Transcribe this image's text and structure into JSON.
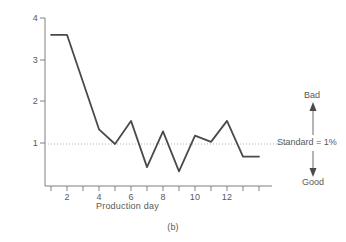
{
  "caption": "(b)",
  "axes": {
    "ylabel": "Defective parts (%)",
    "xlabel": "Production day",
    "yticks": [
      "1",
      "2",
      "3",
      "4"
    ],
    "xticks": [
      "2",
      "4",
      "6",
      "8",
      "10",
      "12"
    ]
  },
  "annotations": {
    "bad": "Bad",
    "good": "Good",
    "standard": "Standard = 1%"
  },
  "colors": {
    "line": "#4a4a4a",
    "axis": "#808080",
    "text": "#595959",
    "reference": "#b0b0b0"
  },
  "chart_data": {
    "type": "line",
    "title": "",
    "xlabel": "Production day",
    "ylabel": "Defective parts (%)",
    "xlim": [
      0.3,
      14.2
    ],
    "ylim": [
      0,
      4
    ],
    "xticks": [
      2,
      4,
      6,
      8,
      10,
      12
    ],
    "xtick_minor": [
      1,
      2,
      3,
      4,
      5,
      6,
      7,
      8,
      9,
      10,
      11,
      12,
      13,
      14
    ],
    "yticks": [
      1,
      2,
      3,
      4
    ],
    "grid": false,
    "legend": false,
    "reference_line": {
      "y": 1,
      "label": "Standard = 1%",
      "style": "dotted"
    },
    "direction_labels": {
      "up": "Bad",
      "down": "Good"
    },
    "x": [
      1,
      2,
      4,
      5,
      6,
      7,
      8,
      9,
      10,
      11,
      12,
      13,
      14
    ],
    "values": [
      3.6,
      3.6,
      1.35,
      1.0,
      1.55,
      0.45,
      1.3,
      0.35,
      1.2,
      1.05,
      1.55,
      0.7,
      0.7
    ],
    "series": [
      {
        "name": "Defective parts",
        "points": [
          {
            "day": 1,
            "pct": 3.6
          },
          {
            "day": 2,
            "pct": 3.6
          },
          {
            "day": 4,
            "pct": 1.35
          },
          {
            "day": 5,
            "pct": 1.0
          },
          {
            "day": 6,
            "pct": 1.55
          },
          {
            "day": 7,
            "pct": 0.45
          },
          {
            "day": 8,
            "pct": 1.3
          },
          {
            "day": 9,
            "pct": 0.35
          },
          {
            "day": 10,
            "pct": 1.2
          },
          {
            "day": 11,
            "pct": 1.05
          },
          {
            "day": 12,
            "pct": 1.55
          },
          {
            "day": 13,
            "pct": 0.7
          },
          {
            "day": 14,
            "pct": 0.7
          }
        ]
      }
    ]
  }
}
